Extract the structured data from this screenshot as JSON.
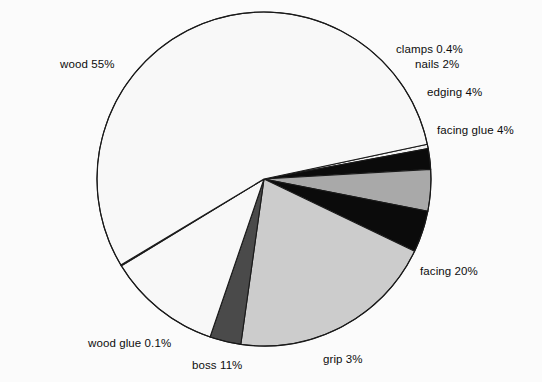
{
  "chart_data": {
    "type": "pie",
    "title": "",
    "subtitle": "",
    "xlabel": "",
    "ylabel": "",
    "units": "percent",
    "legend_position": "none",
    "labels_position": "outside-callout",
    "grid": false,
    "background_color": "#fbfbfb",
    "outline_color": "#1a1a1a",
    "start_angle_deg": -12,
    "direction": "clockwise",
    "center": {
      "x": 264,
      "y": 179
    },
    "radius": 167,
    "categories": [
      "clamps",
      "nails",
      "edging",
      "facing glue",
      "facing",
      "grip",
      "boss",
      "wood glue",
      "wood"
    ],
    "values": [
      0.4,
      2,
      4,
      4,
      20,
      3,
      11,
      0.1,
      55
    ],
    "slices": [
      {
        "label": "clamps",
        "value": 0.4,
        "value_text": "0.4%",
        "label_text": "clamps 0.4%",
        "color": "#f2f2f2"
      },
      {
        "label": "nails",
        "value": 2,
        "value_text": "2%",
        "label_text": "nails 2%",
        "color": "#0b0b0b"
      },
      {
        "label": "edging",
        "value": 4,
        "value_text": "4%",
        "label_text": "edging 4%",
        "color": "#a9a9a9"
      },
      {
        "label": "facing glue",
        "value": 4,
        "value_text": "4%",
        "label_text": "facing glue 4%",
        "color": "#0b0b0b"
      },
      {
        "label": "facing",
        "value": 20,
        "value_text": "20%",
        "label_text": "facing 20%",
        "color": "#cccccc"
      },
      {
        "label": "grip",
        "value": 3,
        "value_text": "3%",
        "label_text": "grip 3%",
        "color": "#4a4a4a"
      },
      {
        "label": "boss",
        "value": 11,
        "value_text": "11%",
        "label_text": "boss 11%",
        "color": "#f8f8f8"
      },
      {
        "label": "wood glue",
        "value": 0.1,
        "value_text": "0.1%",
        "label_text": "wood glue 0.1%",
        "color": "#f8f8f8"
      },
      {
        "label": "wood",
        "value": 55,
        "value_text": "55%",
        "label_text": "wood 55%",
        "color": "#f8f8f8"
      }
    ]
  },
  "labels": {
    "wood": "wood 55%",
    "clamps": "clamps 0.4%",
    "nails": "nails 2%",
    "edging": "edging 4%",
    "facing_glue": "facing glue 4%",
    "facing": "facing 20%",
    "grip": "grip 3%",
    "boss": "boss 11%",
    "wood_glue": "wood glue 0.1%"
  },
  "colors": {
    "background": "#fbfbfb",
    "outline": "#1a1a1a",
    "text": "#0d0d0d",
    "black_slice": "#0b0b0b",
    "mid_gray_slice": "#a9a9a9",
    "light_gray_slice": "#cccccc",
    "dark_gray_slice": "#4a4a4a",
    "white_slice": "#f8f8f8"
  }
}
